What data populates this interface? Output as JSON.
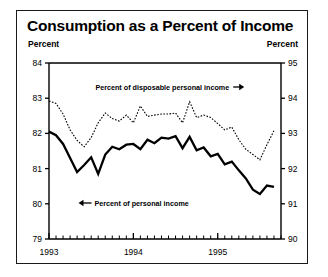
{
  "figure": {
    "title": "Consumption as a Percent of Income",
    "unit_left": "Percent",
    "unit_right": "Percent"
  },
  "chart_data": {
    "type": "line",
    "title": "Consumption as a Percent of Income",
    "xlabel": "",
    "ylabel": "Percent",
    "ylabel_right": "Percent",
    "grid": false,
    "legend": "annotations",
    "xlim": [
      1993.0,
      1995.75
    ],
    "xticks": [
      "1993",
      "1994",
      "1995"
    ],
    "xtick_values": [
      1993.0,
      1994.0,
      1995.0
    ],
    "minor_xticks": "monthly",
    "ylim_left": [
      79,
      84
    ],
    "yticks_left": [
      79,
      80,
      81,
      82,
      83,
      84
    ],
    "ylim_right": [
      90,
      95
    ],
    "yticks_right": [
      90,
      91,
      92,
      93,
      94,
      95
    ],
    "annotations": [
      {
        "text": "Percent of disposable personal income",
        "arrow": "right",
        "target_axis": "right",
        "x": 1993.55,
        "y_px": 76
      },
      {
        "text": "Percent of personal income",
        "arrow": "left",
        "target_axis": "left",
        "x": 1993.35,
        "y_px": 192
      }
    ],
    "series": [
      {
        "name": "Percent of disposable personal income",
        "axis": "right",
        "style": "dotted",
        "linewidth": 1.1,
        "color": "#000000",
        "x": [
          1993.0,
          1993.083,
          1993.167,
          1993.25,
          1993.333,
          1993.417,
          1993.5,
          1993.583,
          1993.667,
          1993.75,
          1993.833,
          1993.917,
          1994.0,
          1994.083,
          1994.167,
          1994.25,
          1994.333,
          1994.417,
          1994.5,
          1994.583,
          1994.667,
          1994.75,
          1994.833,
          1994.917,
          1995.0,
          1995.083,
          1995.167,
          1995.25,
          1995.333,
          1995.417,
          1995.5,
          1995.583,
          1995.667
        ],
        "values": [
          93.92,
          93.85,
          93.55,
          93.1,
          92.8,
          92.62,
          92.88,
          93.3,
          93.58,
          93.42,
          93.35,
          93.52,
          93.3,
          93.78,
          93.48,
          93.52,
          93.55,
          93.55,
          93.58,
          93.3,
          93.9,
          93.45,
          93.52,
          93.45,
          93.28,
          93.1,
          93.18,
          92.82,
          92.55,
          92.4,
          92.25,
          92.68,
          93.08
        ]
      },
      {
        "name": "Percent of personal income",
        "axis": "left",
        "style": "solid",
        "linewidth": 2.3,
        "color": "#000000",
        "x": [
          1993.0,
          1993.083,
          1993.167,
          1993.25,
          1993.333,
          1993.417,
          1993.5,
          1993.583,
          1993.667,
          1993.75,
          1993.833,
          1993.917,
          1994.0,
          1994.083,
          1994.167,
          1994.25,
          1994.333,
          1994.417,
          1994.5,
          1994.583,
          1994.667,
          1994.75,
          1994.833,
          1994.917,
          1995.0,
          1995.083,
          1995.167,
          1995.25,
          1995.333,
          1995.417,
          1995.5,
          1995.583,
          1995.667
        ],
        "values": [
          82.05,
          81.95,
          81.7,
          81.3,
          80.9,
          81.1,
          81.32,
          80.85,
          81.4,
          81.62,
          81.55,
          81.68,
          81.7,
          81.55,
          81.82,
          81.72,
          81.88,
          81.85,
          81.92,
          81.58,
          81.9,
          81.52,
          81.6,
          81.35,
          81.42,
          81.12,
          81.2,
          80.95,
          80.72,
          80.4,
          80.28,
          80.52,
          80.48
        ]
      }
    ]
  }
}
